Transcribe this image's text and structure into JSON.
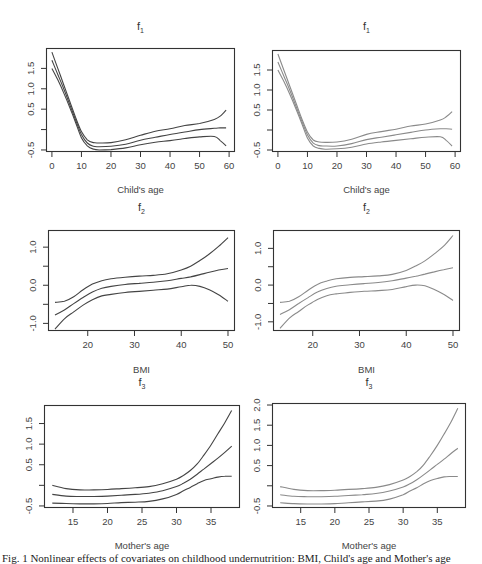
{
  "caption": "Fig. 1 Nonlinear effects of covariates on childhood undernutrition: BMI, Child's age and Mother's age",
  "colors": {
    "left_curves": "#444444",
    "right_curves": "#8a8a8a",
    "frame": "#333333"
  },
  "chart_data": [
    {
      "id": "f1-left",
      "type": "line",
      "title": "f",
      "title_sub": "1",
      "xlabel": "Child's age",
      "ylabel": "",
      "xlim": [
        -2,
        62
      ],
      "ylim": [
        -0.55,
        2.0
      ],
      "xticks": [
        0,
        10,
        20,
        30,
        40,
        50,
        60
      ],
      "xtick_labels": [
        "0",
        "10",
        "20",
        "30",
        "40",
        "50",
        "60"
      ],
      "yticks": [
        -0.5,
        0,
        0.5,
        1.0,
        1.5
      ],
      "ytick_labels": [
        "-0.5",
        "",
        "0.5",
        "1.0",
        "1.5"
      ],
      "grid": false,
      "x": [
        0,
        2,
        4,
        6,
        8,
        10,
        12,
        14,
        16,
        20,
        25,
        30,
        35,
        40,
        45,
        50,
        55,
        57,
        59
      ],
      "series": [
        {
          "name": "upper",
          "values": [
            1.9,
            1.5,
            1.1,
            0.7,
            0.3,
            -0.05,
            -0.25,
            -0.32,
            -0.33,
            -0.32,
            -0.25,
            -0.14,
            -0.04,
            0.02,
            0.1,
            0.15,
            0.25,
            0.33,
            0.48
          ]
        },
        {
          "name": "estimate",
          "values": [
            1.7,
            1.35,
            1.0,
            0.62,
            0.24,
            -0.12,
            -0.33,
            -0.41,
            -0.42,
            -0.41,
            -0.36,
            -0.26,
            -0.19,
            -0.12,
            -0.06,
            0.0,
            0.03,
            0.04,
            0.04
          ]
        },
        {
          "name": "lower",
          "values": [
            1.5,
            1.22,
            0.9,
            0.55,
            0.18,
            -0.2,
            -0.4,
            -0.48,
            -0.5,
            -0.49,
            -0.45,
            -0.37,
            -0.31,
            -0.27,
            -0.22,
            -0.18,
            -0.17,
            -0.27,
            -0.4
          ]
        }
      ]
    },
    {
      "id": "f1-right",
      "type": "line",
      "title": "f",
      "title_sub": "1",
      "xlabel": "Child's age",
      "ylabel": "",
      "xlim": [
        -2,
        62
      ],
      "ylim": [
        -0.55,
        2.0
      ],
      "xticks": [
        0,
        10,
        20,
        30,
        40,
        50,
        60
      ],
      "xtick_labels": [
        "0",
        "10",
        "20",
        "30",
        "40",
        "50",
        "60"
      ],
      "yticks": [
        -0.5,
        0,
        0.5,
        1.0,
        1.5
      ],
      "ytick_labels": [
        "-0.5",
        "",
        "0.5",
        "1.0",
        "1.5"
      ],
      "grid": false,
      "x": [
        0,
        2,
        4,
        6,
        8,
        10,
        12,
        14,
        16,
        20,
        25,
        30,
        35,
        40,
        45,
        50,
        55,
        57,
        59
      ],
      "series": [
        {
          "name": "upper",
          "values": [
            1.9,
            1.5,
            1.1,
            0.7,
            0.3,
            -0.05,
            -0.25,
            -0.3,
            -0.31,
            -0.3,
            -0.23,
            -0.11,
            -0.04,
            0.02,
            0.1,
            0.15,
            0.25,
            0.33,
            0.46
          ]
        },
        {
          "name": "estimate",
          "values": [
            1.7,
            1.35,
            1.0,
            0.62,
            0.24,
            -0.12,
            -0.33,
            -0.39,
            -0.4,
            -0.4,
            -0.34,
            -0.24,
            -0.18,
            -0.12,
            -0.06,
            0.0,
            0.03,
            0.03,
            0.02
          ]
        },
        {
          "name": "lower",
          "values": [
            1.5,
            1.22,
            0.9,
            0.55,
            0.18,
            -0.2,
            -0.4,
            -0.46,
            -0.48,
            -0.47,
            -0.43,
            -0.35,
            -0.3,
            -0.26,
            -0.22,
            -0.18,
            -0.17,
            -0.26,
            -0.4
          ]
        }
      ]
    },
    {
      "id": "f2-left",
      "type": "line",
      "title": "f",
      "title_sub": "2",
      "xlabel": "BMI",
      "ylabel": "",
      "xlim": [
        11.5,
        51.5
      ],
      "ylim": [
        -1.2,
        1.45
      ],
      "xticks": [
        20,
        30,
        40,
        50
      ],
      "xtick_labels": [
        "20",
        "30",
        "40",
        "50"
      ],
      "yticks": [
        -1.0,
        -0.5,
        0.0,
        0.5,
        1.0
      ],
      "ytick_labels": [
        "-1.0",
        "",
        "0.0",
        "",
        "1.0"
      ],
      "grid": false,
      "x": [
        13,
        15,
        17,
        19,
        21,
        23,
        25,
        28,
        31,
        34,
        37,
        40,
        42,
        44,
        46,
        48,
        50
      ],
      "series": [
        {
          "name": "upper",
          "values": [
            -0.45,
            -0.42,
            -0.3,
            -0.12,
            0.03,
            0.12,
            0.17,
            0.21,
            0.24,
            0.26,
            0.3,
            0.4,
            0.5,
            0.65,
            0.82,
            1.02,
            1.25
          ]
        },
        {
          "name": "estimate",
          "values": [
            -0.78,
            -0.65,
            -0.48,
            -0.32,
            -0.18,
            -0.08,
            -0.03,
            0.02,
            0.05,
            0.08,
            0.12,
            0.18,
            0.22,
            0.28,
            0.34,
            0.4,
            0.44
          ]
        },
        {
          "name": "lower",
          "values": [
            -1.15,
            -0.88,
            -0.7,
            -0.52,
            -0.38,
            -0.28,
            -0.24,
            -0.19,
            -0.16,
            -0.13,
            -0.1,
            -0.04,
            0.0,
            -0.03,
            -0.12,
            -0.25,
            -0.42
          ]
        }
      ]
    },
    {
      "id": "f2-right",
      "type": "line",
      "title": "f",
      "title_sub": "2",
      "xlabel": "BMI",
      "ylabel": "",
      "xlim": [
        11.5,
        51.5
      ],
      "ylim": [
        -1.25,
        1.5
      ],
      "xticks": [
        20,
        30,
        40,
        50
      ],
      "xtick_labels": [
        "20",
        "30",
        "40",
        "50"
      ],
      "yticks": [
        -1.0,
        -0.5,
        0.0,
        0.5,
        1.0
      ],
      "ytick_labels": [
        "-1.0",
        "",
        "0.0",
        "",
        "1.0"
      ],
      "grid": false,
      "x": [
        13,
        15,
        17,
        19,
        21,
        23,
        25,
        28,
        31,
        34,
        37,
        40,
        42,
        44,
        46,
        48,
        50
      ],
      "series": [
        {
          "name": "upper",
          "values": [
            -0.47,
            -0.44,
            -0.32,
            -0.14,
            0.02,
            0.11,
            0.17,
            0.21,
            0.23,
            0.25,
            0.29,
            0.4,
            0.52,
            0.66,
            0.85,
            1.06,
            1.35
          ]
        },
        {
          "name": "estimate",
          "values": [
            -0.8,
            -0.67,
            -0.5,
            -0.34,
            -0.19,
            -0.09,
            -0.03,
            0.01,
            0.04,
            0.07,
            0.12,
            0.19,
            0.24,
            0.3,
            0.36,
            0.42,
            0.47
          ]
        },
        {
          "name": "lower",
          "values": [
            -1.18,
            -0.9,
            -0.72,
            -0.54,
            -0.39,
            -0.29,
            -0.24,
            -0.2,
            -0.17,
            -0.15,
            -0.12,
            -0.04,
            0.0,
            -0.02,
            -0.12,
            -0.25,
            -0.42
          ]
        }
      ]
    },
    {
      "id": "f3-left",
      "type": "line",
      "title": "f",
      "title_sub": "3",
      "xlabel": "Mother's age",
      "ylabel": "",
      "xlim": [
        10.8,
        39.2
      ],
      "ylim": [
        -0.55,
        1.95
      ],
      "xticks": [
        15,
        20,
        25,
        30,
        35
      ],
      "xtick_labels": [
        "15",
        "20",
        "25",
        "30",
        "35"
      ],
      "yticks": [
        -0.5,
        0,
        0.5,
        1.0,
        1.5
      ],
      "ytick_labels": [
        "-0.5",
        "",
        "0.5",
        "1.0",
        "1.5"
      ],
      "grid": false,
      "x": [
        12,
        14,
        16,
        18,
        20,
        22,
        24,
        26,
        28,
        30,
        31,
        32,
        33,
        34,
        35,
        36,
        37,
        38
      ],
      "series": [
        {
          "name": "upper",
          "values": [
            0.0,
            -0.08,
            -0.11,
            -0.11,
            -0.1,
            -0.08,
            -0.06,
            -0.03,
            0.04,
            0.15,
            0.24,
            0.36,
            0.52,
            0.74,
            0.98,
            1.25,
            1.52,
            1.82
          ]
        },
        {
          "name": "estimate",
          "values": [
            -0.22,
            -0.26,
            -0.27,
            -0.27,
            -0.26,
            -0.24,
            -0.22,
            -0.19,
            -0.13,
            -0.03,
            0.05,
            0.15,
            0.27,
            0.4,
            0.53,
            0.66,
            0.8,
            0.95
          ]
        },
        {
          "name": "lower",
          "values": [
            -0.43,
            -0.44,
            -0.45,
            -0.45,
            -0.44,
            -0.42,
            -0.41,
            -0.39,
            -0.33,
            -0.22,
            -0.13,
            -0.05,
            0.04,
            0.12,
            0.16,
            0.2,
            0.22,
            0.22
          ]
        }
      ]
    },
    {
      "id": "f3-right",
      "type": "line",
      "title": "f",
      "title_sub": "3",
      "xlabel": "Mother's age",
      "ylabel": "",
      "xlim": [
        10.8,
        39.2
      ],
      "ylim": [
        -0.55,
        2.05
      ],
      "xticks": [
        15,
        20,
        25,
        30,
        35
      ],
      "xtick_labels": [
        "15",
        "20",
        "25",
        "30",
        "35"
      ],
      "yticks": [
        -0.5,
        0,
        0.5,
        1.0,
        1.5,
        2.0
      ],
      "ytick_labels": [
        "-0.5",
        "",
        "0.5",
        "1.0",
        "1.5",
        "2.0"
      ],
      "grid": false,
      "x": [
        12,
        14,
        16,
        18,
        20,
        22,
        24,
        26,
        28,
        30,
        31,
        32,
        33,
        34,
        35,
        36,
        37,
        38
      ],
      "series": [
        {
          "name": "upper",
          "values": [
            -0.02,
            -0.09,
            -0.12,
            -0.12,
            -0.11,
            -0.09,
            -0.07,
            -0.04,
            0.03,
            0.14,
            0.23,
            0.35,
            0.52,
            0.75,
            1.0,
            1.28,
            1.58,
            1.92
          ]
        },
        {
          "name": "estimate",
          "values": [
            -0.22,
            -0.26,
            -0.27,
            -0.27,
            -0.26,
            -0.24,
            -0.22,
            -0.19,
            -0.13,
            -0.03,
            0.05,
            0.15,
            0.27,
            0.4,
            0.53,
            0.66,
            0.8,
            0.93
          ]
        },
        {
          "name": "lower",
          "values": [
            -0.42,
            -0.44,
            -0.45,
            -0.45,
            -0.44,
            -0.42,
            -0.4,
            -0.38,
            -0.33,
            -0.22,
            -0.13,
            -0.05,
            0.05,
            0.13,
            0.18,
            0.22,
            0.23,
            0.23
          ]
        }
      ]
    }
  ],
  "layout": [
    {
      "left": 46,
      "top": 48,
      "w": 189,
      "h": 104,
      "title_top": 20,
      "xlabel_top": 184,
      "curve_color": "left"
    },
    {
      "left": 272,
      "top": 50,
      "w": 189,
      "h": 102,
      "title_top": 20,
      "xlabel_top": 184,
      "curve_color": "right"
    },
    {
      "left": 48,
      "top": 230,
      "w": 187,
      "h": 101,
      "title_top": 201,
      "xlabel_top": 364,
      "curve_color": "left"
    },
    {
      "left": 273,
      "top": 230,
      "w": 187,
      "h": 101,
      "title_top": 201,
      "xlabel_top": 364,
      "curve_color": "right"
    },
    {
      "left": 44,
      "top": 405,
      "w": 196,
      "h": 103,
      "title_top": 376,
      "xlabel_top": 540,
      "curve_color": "left"
    },
    {
      "left": 272,
      "top": 403,
      "w": 194,
      "h": 105,
      "title_top": 376,
      "xlabel_top": 540,
      "curve_color": "right"
    }
  ]
}
